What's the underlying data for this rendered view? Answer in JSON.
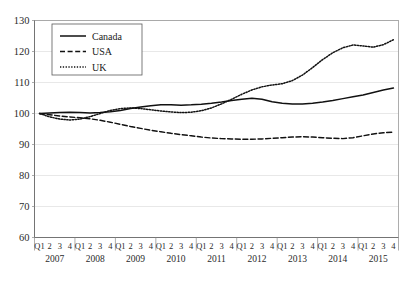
{
  "chart_data": {
    "type": "line",
    "title": "",
    "xlabel": "",
    "ylabel": "",
    "ylim": [
      60,
      130
    ],
    "yticks": [
      60,
      70,
      80,
      90,
      100,
      110,
      120,
      130
    ],
    "grid": true,
    "legend_position": "top-left",
    "years": [
      "2007",
      "2008",
      "2009",
      "2010",
      "2011",
      "2012",
      "2013",
      "2014",
      "2015"
    ],
    "quarter_labels": [
      "Q1",
      "2",
      "3",
      "4"
    ],
    "x": [
      "2007 Q1",
      "2007 Q2",
      "2007 Q3",
      "2007 Q4",
      "2008 Q1",
      "2008 Q2",
      "2008 Q3",
      "2008 Q4",
      "2009 Q1",
      "2009 Q2",
      "2009 Q3",
      "2009 Q4",
      "2010 Q1",
      "2010 Q2",
      "2010 Q3",
      "2010 Q4",
      "2011 Q1",
      "2011 Q2",
      "2011 Q3",
      "2011 Q4",
      "2012 Q1",
      "2012 Q2",
      "2012 Q3",
      "2012 Q4",
      "2013 Q1",
      "2013 Q2",
      "2013 Q3",
      "2013 Q4",
      "2014 Q1",
      "2014 Q2",
      "2014 Q3",
      "2014 Q4",
      "2015 Q1",
      "2015 Q2",
      "2015 Q3",
      "2015 Q4"
    ],
    "series": [
      {
        "name": "Canada",
        "style": "solid",
        "color": "#111111",
        "values": [
          100.0,
          100.2,
          100.3,
          100.4,
          100.3,
          100.2,
          100.3,
          100.6,
          101.0,
          101.6,
          102.1,
          102.5,
          102.8,
          102.8,
          102.7,
          102.8,
          103.0,
          103.3,
          103.7,
          104.2,
          104.6,
          104.9,
          104.6,
          103.8,
          103.3,
          103.1,
          103.1,
          103.3,
          103.7,
          104.2,
          104.8,
          105.4,
          106.0,
          106.8,
          107.6,
          108.2
        ]
      },
      {
        "name": "USA",
        "style": "dashed",
        "color": "#111111",
        "values": [
          100.0,
          99.6,
          99.2,
          98.9,
          98.6,
          98.3,
          97.8,
          97.2,
          96.5,
          95.8,
          95.2,
          94.6,
          94.1,
          93.6,
          93.2,
          92.8,
          92.4,
          92.1,
          91.9,
          91.8,
          91.7,
          91.7,
          91.8,
          92.0,
          92.2,
          92.4,
          92.5,
          92.4,
          92.2,
          92.0,
          91.9,
          92.2,
          92.8,
          93.4,
          93.8,
          94.0
        ]
      },
      {
        "name": "UK",
        "style": "dotted",
        "color": "#111111",
        "values": [
          100.0,
          98.9,
          98.2,
          97.9,
          98.2,
          99.0,
          100.0,
          101.0,
          101.6,
          101.8,
          101.6,
          101.2,
          100.8,
          100.5,
          100.3,
          100.4,
          100.9,
          101.8,
          103.1,
          104.6,
          106.2,
          107.6,
          108.6,
          109.2,
          109.6,
          110.6,
          112.4,
          114.8,
          117.4,
          119.6,
          121.2,
          122.1,
          121.8,
          121.4,
          122.2,
          123.8
        ]
      }
    ]
  },
  "legend": {
    "entries": [
      {
        "label": "Canada",
        "style": "solid"
      },
      {
        "label": "USA",
        "style": "dashed"
      },
      {
        "label": "UK",
        "style": "dotted"
      }
    ]
  }
}
